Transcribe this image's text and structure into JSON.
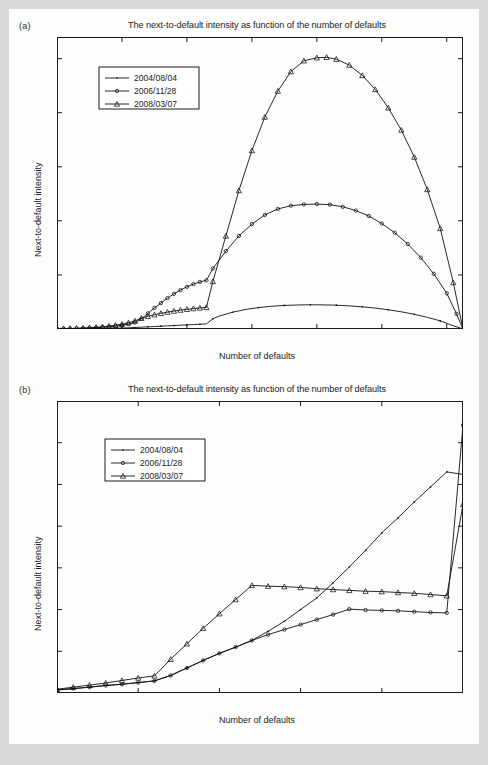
{
  "figure": {
    "background_color": "#d9d9d7",
    "sheet_color": "#fdfdfc",
    "line_color": "#111111"
  },
  "panels": [
    {
      "id": "a",
      "label": "(a)",
      "title": "The next-to-default intensity as function of the number of defaults",
      "xlabel": "Number of defaults",
      "ylabel": "Next-to-default intensity"
    },
    {
      "id": "b",
      "label": "(b)",
      "title": "The next-to-default intensity as function of the number of defaults",
      "xlabel": "Number of defaults",
      "ylabel": "Next-to-default intensity"
    }
  ],
  "legend": {
    "entries": [
      {
        "label": "2004/08/04",
        "marker": "dot-small"
      },
      {
        "label": "2006/11/28",
        "marker": "circle"
      },
      {
        "label": "2008/03/07",
        "marker": "triangle"
      }
    ]
  },
  "chart_data": [
    {
      "type": "line",
      "panel": "a",
      "title": "The next-to-default intensity as function of the number of defaults",
      "xlabel": "Number of defaults",
      "ylabel": "Next-to-default intensity",
      "xlim": [
        0,
        125
      ],
      "ylim": [
        0,
        2700
      ],
      "xticks": [
        0,
        20,
        40,
        60,
        80,
        100,
        120
      ],
      "yticks": [
        0,
        500,
        1000,
        1500,
        2000,
        2500
      ],
      "grid": false,
      "legend_position": "upper-left",
      "series": [
        {
          "name": "2004/08/04",
          "marker": "dot-small",
          "x": [
            0,
            2,
            4,
            6,
            8,
            10,
            12,
            14,
            16,
            18,
            20,
            22,
            24,
            26,
            28,
            30,
            32,
            34,
            36,
            38,
            40,
            42,
            44,
            46,
            48,
            50,
            54,
            58,
            62,
            66,
            70,
            74,
            78,
            82,
            86,
            90,
            94,
            98,
            102,
            106,
            110,
            114,
            118,
            122,
            125
          ],
          "y": [
            1,
            1,
            2,
            2,
            3,
            3,
            4,
            5,
            6,
            7,
            9,
            11,
            14,
            17,
            20,
            23,
            26,
            29,
            32,
            35,
            38,
            41,
            44,
            47,
            95,
            120,
            155,
            180,
            198,
            210,
            218,
            222,
            224,
            223,
            220,
            214,
            205,
            193,
            178,
            159,
            136,
            108,
            75,
            30,
            0
          ]
        },
        {
          "name": "2006/11/28",
          "marker": "circle",
          "x": [
            0,
            2,
            4,
            6,
            8,
            10,
            12,
            14,
            16,
            18,
            20,
            22,
            24,
            26,
            28,
            30,
            32,
            34,
            36,
            38,
            40,
            42,
            44,
            46,
            48,
            52,
            56,
            60,
            64,
            68,
            72,
            76,
            80,
            84,
            88,
            92,
            96,
            100,
            104,
            108,
            112,
            116,
            120,
            123,
            125
          ],
          "y": [
            2,
            3,
            4,
            5,
            7,
            9,
            12,
            16,
            20,
            26,
            34,
            45,
            60,
            95,
            145,
            195,
            240,
            285,
            325,
            360,
            390,
            415,
            435,
            450,
            560,
            720,
            860,
            970,
            1055,
            1110,
            1140,
            1152,
            1155,
            1150,
            1130,
            1095,
            1045,
            975,
            890,
            785,
            660,
            510,
            330,
            140,
            0
          ]
        },
        {
          "name": "2008/03/07",
          "marker": "triangle",
          "x": [
            0,
            2,
            4,
            6,
            8,
            10,
            12,
            14,
            16,
            18,
            20,
            22,
            24,
            26,
            28,
            30,
            32,
            34,
            36,
            38,
            40,
            42,
            44,
            46,
            48,
            52,
            56,
            60,
            64,
            68,
            72,
            76,
            80,
            83,
            86,
            90,
            94,
            98,
            102,
            106,
            110,
            114,
            118,
            122,
            125
          ],
          "y": [
            3,
            4,
            5,
            7,
            9,
            12,
            16,
            21,
            27,
            35,
            45,
            58,
            75,
            100,
            118,
            132,
            145,
            156,
            166,
            175,
            182,
            189,
            195,
            200,
            440,
            860,
            1280,
            1650,
            1960,
            2200,
            2380,
            2480,
            2508,
            2512,
            2495,
            2440,
            2345,
            2215,
            2045,
            1840,
            1590,
            1290,
            930,
            430,
            0
          ]
        }
      ]
    },
    {
      "type": "line",
      "panel": "b",
      "title": "The next-to-default intensity as function of the number of defaults",
      "xlabel": "Number of defaults",
      "ylabel": "Next-to-default intensity",
      "xlim": [
        0,
        25
      ],
      "ylim": [
        0,
        35
      ],
      "xticks": [
        0,
        5,
        10,
        15,
        20,
        25
      ],
      "yticks": [
        0,
        5,
        10,
        15,
        20,
        25,
        30,
        35
      ],
      "grid": false,
      "legend_position": "upper-left",
      "series": [
        {
          "name": "2004/08/04",
          "marker": "dot-small",
          "x": [
            0,
            1,
            2,
            3,
            4,
            5,
            6,
            7,
            8,
            9,
            10,
            11,
            12,
            13,
            14,
            15,
            16,
            17,
            18,
            19,
            20,
            21,
            22,
            23,
            24,
            25
          ],
          "y": [
            0.35,
            0.5,
            0.7,
            0.9,
            1.05,
            1.25,
            1.45,
            2.1,
            3.0,
            3.9,
            4.75,
            5.5,
            6.3,
            7.4,
            8.6,
            10.0,
            11.4,
            13.2,
            15.1,
            17.1,
            19.2,
            21.0,
            22.9,
            24.7,
            26.5,
            26.2
          ]
        },
        {
          "name": "2006/11/28",
          "marker": "circle",
          "x": [
            0,
            1,
            2,
            3,
            4,
            5,
            6,
            7,
            8,
            9,
            10,
            11,
            12,
            13,
            14,
            15,
            16,
            17,
            18,
            19,
            20,
            21,
            22,
            23,
            24,
            25
          ],
          "y": [
            0.4,
            0.55,
            0.7,
            0.9,
            1.05,
            1.25,
            1.45,
            2.1,
            3.0,
            3.9,
            4.75,
            5.5,
            6.3,
            7.0,
            7.6,
            8.2,
            8.8,
            9.4,
            10.05,
            9.95,
            9.9,
            9.85,
            9.75,
            9.65,
            9.6,
            32.1
          ]
        },
        {
          "name": "2008/03/07",
          "marker": "triangle",
          "x": [
            0,
            1,
            2,
            3,
            4,
            5,
            6,
            7,
            8,
            9,
            10,
            11,
            12,
            13,
            14,
            15,
            16,
            17,
            18,
            19,
            20,
            21,
            22,
            23,
            24,
            25
          ],
          "y": [
            0.45,
            0.7,
            0.95,
            1.2,
            1.5,
            1.8,
            2.05,
            4.05,
            5.9,
            7.75,
            9.5,
            11.2,
            12.9,
            12.8,
            12.75,
            12.65,
            12.5,
            12.4,
            12.3,
            12.2,
            12.15,
            12.05,
            11.95,
            11.8,
            11.65,
            22.6
          ]
        }
      ]
    }
  ]
}
